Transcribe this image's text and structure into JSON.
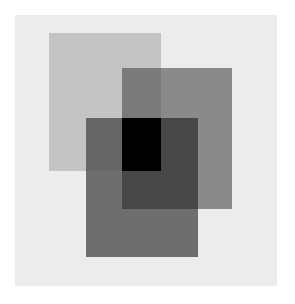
{
  "artwork": {
    "description": "Three overlapping translucent gray rectangles on a light gray panel",
    "background_color": "#ffffff",
    "panel": {
      "x": 15,
      "y": 15,
      "w": 262,
      "h": 271,
      "color": "#ececec"
    },
    "rectangles": [
      {
        "name": "rect-a",
        "x": 49,
        "y": 33,
        "w": 112,
        "h": 138,
        "color": "#c4c4c4"
      },
      {
        "name": "rect-b",
        "x": 122,
        "y": 68,
        "w": 110,
        "h": 141,
        "color": "#8a8a8a"
      },
      {
        "name": "rect-c",
        "x": 86,
        "y": 118,
        "w": 112,
        "h": 139,
        "color": "#6e6e6e"
      }
    ],
    "overlaps": [
      {
        "name": "overlap-a-b",
        "x": 122,
        "y": 68,
        "w": 39,
        "h": 50,
        "color": "#7a7a7a"
      },
      {
        "name": "overlap-a-c",
        "x": 86,
        "y": 118,
        "w": 36,
        "h": 53,
        "color": "#666666"
      },
      {
        "name": "overlap-b-c",
        "x": 122,
        "y": 118,
        "w": 76,
        "h": 91,
        "color": "#474747"
      },
      {
        "name": "overlap-a-b-c",
        "x": 122,
        "y": 118,
        "w": 39,
        "h": 53,
        "color": "#000000"
      }
    ]
  }
}
